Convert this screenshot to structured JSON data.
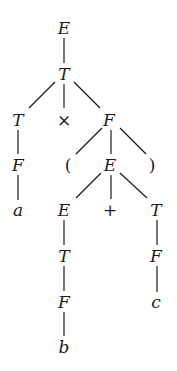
{
  "diagram": {
    "type": "parse-tree",
    "colors": {
      "ink": "#1a1a1a",
      "background": "#ffffff"
    },
    "nodes": [
      {
        "id": "n0",
        "label": "E",
        "x": 64,
        "y": 28,
        "italic": true
      },
      {
        "id": "n1",
        "label": "T",
        "x": 64,
        "y": 74,
        "italic": true
      },
      {
        "id": "n2",
        "label": "T",
        "x": 18,
        "y": 120,
        "italic": true
      },
      {
        "id": "n3",
        "label": "×",
        "x": 64,
        "y": 120,
        "italic": false
      },
      {
        "id": "n4",
        "label": "F",
        "x": 109,
        "y": 120,
        "italic": true
      },
      {
        "id": "n5",
        "label": "F",
        "x": 18,
        "y": 165,
        "italic": true
      },
      {
        "id": "n6",
        "label": "(",
        "x": 68,
        "y": 165,
        "italic": false
      },
      {
        "id": "n7",
        "label": "E",
        "x": 110,
        "y": 165,
        "italic": true
      },
      {
        "id": "n8",
        "label": ")",
        "x": 152,
        "y": 165,
        "italic": false
      },
      {
        "id": "n9",
        "label": "a",
        "x": 18,
        "y": 210,
        "italic": true
      },
      {
        "id": "n10",
        "label": "E",
        "x": 64,
        "y": 210,
        "italic": true
      },
      {
        "id": "n11",
        "label": "+",
        "x": 110,
        "y": 210,
        "italic": false
      },
      {
        "id": "n12",
        "label": "T",
        "x": 156,
        "y": 210,
        "italic": true
      },
      {
        "id": "n13",
        "label": "T",
        "x": 64,
        "y": 256,
        "italic": true
      },
      {
        "id": "n14",
        "label": "F",
        "x": 156,
        "y": 256,
        "italic": true
      },
      {
        "id": "n15",
        "label": "F",
        "x": 64,
        "y": 302,
        "italic": true
      },
      {
        "id": "n16",
        "label": "c",
        "x": 156,
        "y": 302,
        "italic": true
      },
      {
        "id": "n17",
        "label": "b",
        "x": 64,
        "y": 347,
        "italic": true
      }
    ],
    "edges": [
      {
        "from": "n0",
        "to": "n1",
        "x1": 64,
        "y1": 38,
        "x2": 64,
        "y2": 63
      },
      {
        "from": "n1",
        "to": "n2",
        "x1": 55,
        "y1": 82,
        "x2": 29,
        "y2": 108
      },
      {
        "from": "n1",
        "to": "n3",
        "x1": 64,
        "y1": 84,
        "x2": 64,
        "y2": 108
      },
      {
        "from": "n1",
        "to": "n4",
        "x1": 74,
        "y1": 82,
        "x2": 100,
        "y2": 108
      },
      {
        "from": "n2",
        "to": "n5",
        "x1": 18,
        "y1": 130,
        "x2": 18,
        "y2": 154
      },
      {
        "from": "n4",
        "to": "n6",
        "x1": 102,
        "y1": 128,
        "x2": 76,
        "y2": 154
      },
      {
        "from": "n4",
        "to": "n7",
        "x1": 111,
        "y1": 130,
        "x2": 111,
        "y2": 154
      },
      {
        "from": "n4",
        "to": "n8",
        "x1": 120,
        "y1": 128,
        "x2": 146,
        "y2": 154
      },
      {
        "from": "n5",
        "to": "n9",
        "x1": 18,
        "y1": 175,
        "x2": 18,
        "y2": 200
      },
      {
        "from": "n7",
        "to": "n10",
        "x1": 101,
        "y1": 173,
        "x2": 76,
        "y2": 198
      },
      {
        "from": "n7",
        "to": "n11",
        "x1": 111,
        "y1": 175,
        "x2": 111,
        "y2": 199
      },
      {
        "from": "n7",
        "to": "n12",
        "x1": 120,
        "y1": 173,
        "x2": 147,
        "y2": 198
      },
      {
        "from": "n10",
        "to": "n13",
        "x1": 64,
        "y1": 220,
        "x2": 64,
        "y2": 245
      },
      {
        "from": "n12",
        "to": "n14",
        "x1": 157,
        "y1": 220,
        "x2": 157,
        "y2": 245
      },
      {
        "from": "n13",
        "to": "n15",
        "x1": 64,
        "y1": 266,
        "x2": 64,
        "y2": 291
      },
      {
        "from": "n14",
        "to": "n16",
        "x1": 157,
        "y1": 266,
        "x2": 157,
        "y2": 292
      },
      {
        "from": "n15",
        "to": "n17",
        "x1": 64,
        "y1": 312,
        "x2": 64,
        "y2": 336
      }
    ]
  }
}
